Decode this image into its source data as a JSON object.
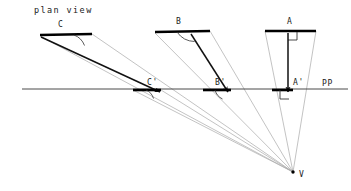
{
  "title": "plan view",
  "picture_plane": {
    "label": "PP",
    "label_x": 322,
    "label_y": 86,
    "y": 89,
    "x_start": 22,
    "x_end": 348,
    "color": "#4a4a4a"
  },
  "vanishing_point": {
    "label": "V",
    "x": 293,
    "y": 172,
    "label_x": 299,
    "label_y": 177
  },
  "colors": {
    "object": "#000000",
    "sight_line": "#a9a9a9",
    "projection": "#111111",
    "plane_line": "#4a4a4a",
    "text": "#1a1a1a"
  },
  "objects": [
    {
      "name": "segment-c",
      "label": "C",
      "label_x": 58,
      "label_y": 27,
      "x1": 40,
      "y1": 35,
      "x2": 92,
      "y2": 34,
      "marker": "arc",
      "arc_at": "right",
      "image": {
        "label": "C'",
        "label_x": 147,
        "label_y": 85,
        "x1": 133,
        "y1": 90,
        "x2": 161,
        "y2": 90,
        "marker": "arc"
      },
      "projection_arrow": {
        "x1": 41,
        "y1": 37,
        "x2": 160,
        "y2": 92
      }
    },
    {
      "name": "segment-b",
      "label": "B",
      "label_x": 176,
      "label_y": 24,
      "x1": 155,
      "y1": 32,
      "x2": 210,
      "y2": 31,
      "marker": "arc",
      "arc_at": "right",
      "image": {
        "label": "B'",
        "label_x": 215,
        "label_y": 85,
        "x1": 203,
        "y1": 90,
        "x2": 231,
        "y2": 90,
        "marker": "arc"
      },
      "projection_arrow": {
        "x1": 191,
        "y1": 34,
        "x2": 228,
        "y2": 92
      }
    },
    {
      "name": "segment-a",
      "label": "A",
      "label_x": 287,
      "label_y": 24,
      "x1": 265,
      "y1": 31,
      "x2": 316,
      "y2": 31,
      "marker": "right-angle",
      "arc_at": "center",
      "image": {
        "label": "A'",
        "label_x": 293,
        "label_y": 85,
        "x1": 272,
        "y1": 90,
        "x2": 293,
        "y2": 90,
        "marker": "right-angle"
      },
      "projection_arrow": {
        "x1": 288,
        "y1": 33,
        "x2": 288,
        "y2": 92
      }
    }
  ],
  "sight_lines": [
    {
      "name": "sight-c-left",
      "x1": 40,
      "y1": 36,
      "x2": 293,
      "y2": 172
    },
    {
      "name": "sight-c-right",
      "x1": 92,
      "y1": 34,
      "x2": 293,
      "y2": 172
    },
    {
      "name": "sight-b-left",
      "x1": 155,
      "y1": 33,
      "x2": 293,
      "y2": 172
    },
    {
      "name": "sight-b-right",
      "x1": 210,
      "y1": 31,
      "x2": 293,
      "y2": 172
    },
    {
      "name": "sight-a-left",
      "x1": 265,
      "y1": 31,
      "x2": 293,
      "y2": 172
    },
    {
      "name": "sight-a-right",
      "x1": 316,
      "y1": 31,
      "x2": 293,
      "y2": 172
    },
    {
      "name": "sight-cprime-left",
      "x1": 133,
      "y1": 90,
      "x2": 293,
      "y2": 172
    },
    {
      "name": "sight-cprime-right",
      "x1": 161,
      "y1": 90,
      "x2": 293,
      "y2": 172
    }
  ]
}
